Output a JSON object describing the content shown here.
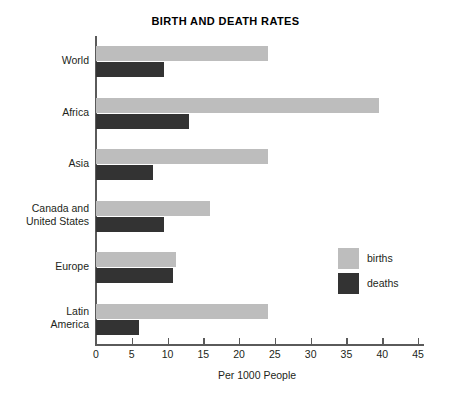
{
  "chart_data": {
    "type": "bar",
    "orientation": "horizontal",
    "title": "BIRTH AND DEATH RATES",
    "xlabel": "Per 1000 People",
    "ylabel": "",
    "xlim": [
      0,
      45
    ],
    "xticks": [
      0,
      5,
      10,
      15,
      20,
      25,
      30,
      35,
      40,
      45
    ],
    "xtick_labels": [
      "0",
      "5",
      "10",
      "15",
      "20",
      "25",
      "30",
      "35",
      "40",
      "45"
    ],
    "grid": false,
    "legend_position": "middle-right",
    "categories": [
      "World",
      "Africa",
      "Asia",
      "Canada and\nUnited States",
      "Europe",
      "Latin\nAmerica"
    ],
    "series": [
      {
        "name": "births",
        "color": "#bdbdbd",
        "values": [
          24,
          39.5,
          24,
          16,
          11.2,
          24
        ]
      },
      {
        "name": "deaths",
        "color": "#333333",
        "values": [
          9.5,
          13,
          8,
          9.5,
          10.8,
          6
        ]
      }
    ]
  },
  "legend": {
    "items": [
      {
        "label": "births",
        "color": "#bdbdbd"
      },
      {
        "label": "deaths",
        "color": "#333333"
      }
    ]
  },
  "colors": {
    "births": "#bdbdbd",
    "deaths": "#333333",
    "axis": "#5a5a5a",
    "text": "#231f20",
    "background": "#ffffff"
  }
}
